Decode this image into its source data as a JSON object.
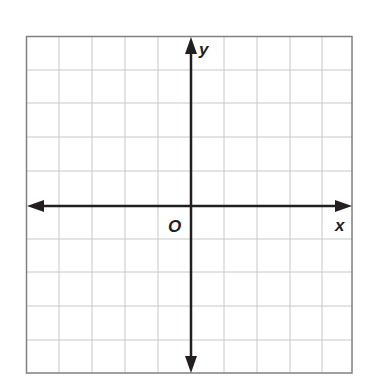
{
  "diagram": {
    "type": "coordinate-plane",
    "grid": {
      "columns": 10,
      "rows": 10,
      "line_color": "#c8c8c8",
      "border_color": "#707070"
    },
    "axes": {
      "x_label": "x",
      "y_label": "y",
      "origin_label": "O",
      "axis_color": "#231f20"
    }
  }
}
